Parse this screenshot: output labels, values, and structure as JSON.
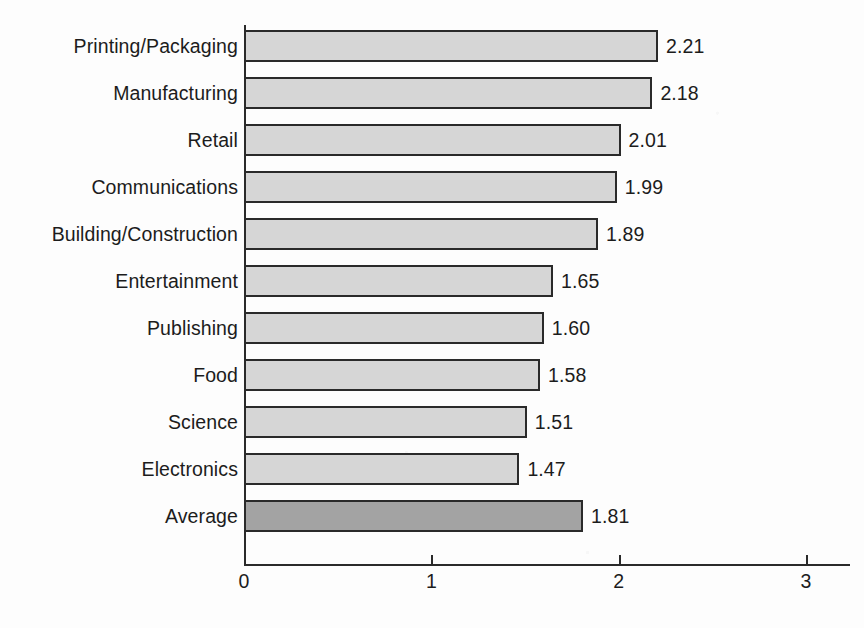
{
  "chart_data": {
    "type": "bar",
    "orientation": "horizontal",
    "title": "",
    "subtitle": "",
    "xlabel": "",
    "ylabel": "",
    "xlim": [
      0,
      3
    ],
    "xticks": [
      "0",
      "1",
      "2",
      "3"
    ],
    "grid": false,
    "legend": "none",
    "categories": [
      "Printing/Packaging",
      "Manufacturing",
      "Retail",
      "Communications",
      "Building/Construction",
      "Entertainment",
      "Publishing",
      "Food",
      "Science",
      "Electronics",
      "Average"
    ],
    "values": [
      2.21,
      2.18,
      2.01,
      1.99,
      1.89,
      1.65,
      1.6,
      1.58,
      1.51,
      1.47,
      1.81
    ],
    "value_labels": [
      "2.21",
      "2.18",
      "2.01",
      "1.99",
      "1.89",
      "1.65",
      "1.60",
      "1.58",
      "1.51",
      "1.47",
      "1.81"
    ],
    "highlight_index": 10,
    "colors": {
      "bar_fill": "#d6d6d6",
      "bar_highlight_fill": "#a3a3a3",
      "bar_border": "#2a2a2a",
      "axis": "#2a2a2a",
      "text": "#1c1c1c",
      "background": "#fdfdfd"
    }
  }
}
